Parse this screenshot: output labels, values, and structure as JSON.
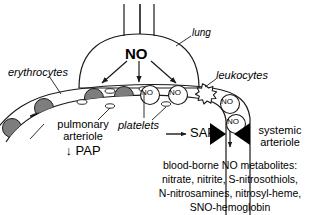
{
  "figure": {
    "labels": {
      "lung": "lung",
      "no_lung": "NO",
      "erythrocytes": "erythrocytes",
      "leukocytes": "leukocytes",
      "platelets": "platelets",
      "pulmonary_arteriole_line1": "pulmonary",
      "pulmonary_arteriole_line2": "arteriole",
      "pap": "↓ PAP",
      "sap": "SAP",
      "systemic_arteriole_line1": "systemic",
      "systemic_arteriole_line2": "arteriole",
      "no_molecule": "NO"
    },
    "metabolites": {
      "line1": "blood-borne NO metabolites:",
      "line2": "nitrate, nitrite, S-nitrosothiols,",
      "line3": "N-nitrosamines, nitrosyl-heme,",
      "line4": "SNO-hemoglobin"
    },
    "no_circles": [
      "NO",
      "NO",
      "NO",
      "NO"
    ],
    "colors": {
      "stroke": "#1a1a1a",
      "erythrocyte_fill": "#7d7d7d",
      "background": "#ffffff",
      "triangle_fill": "#000000"
    }
  }
}
